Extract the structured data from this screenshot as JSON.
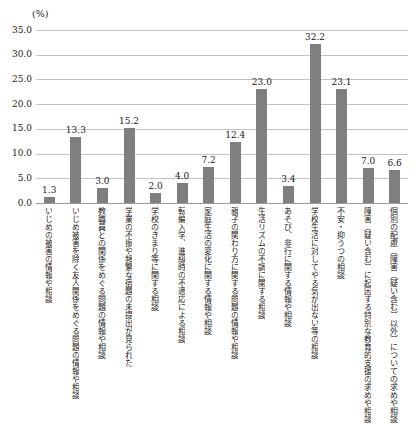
{
  "chart_data": {
    "type": "bar",
    "title": "",
    "unit_label": "(%)",
    "categories": [
      "いじめの被害の情報や相談",
      "いじめ被害を除く友人関係をめぐる問題の情報や相談",
      "教職員との関係をめぐる問題の情報や相談",
      "学業の不振や頻繁な宿題の未提出が見られた",
      "学校のきまり等に関する相談",
      "転編入学、進級時の不適応による相談",
      "家庭生活の変化に関する情報や相談",
      "親子の関わり方に関する問題の情報や相談",
      "生活リズムの不調に関する相談",
      "あそび、非行に関する情報や相談",
      "学校生活に対してやる気が出ない等の相談",
      "不安・抑うつの相談",
      "障害（疑い含む）に起因する特別な教育的支援の求めや相談",
      "個別の配慮（障害（疑い含む）以外）についての求めや相談"
    ],
    "values": [
      1.3,
      13.3,
      3.0,
      15.2,
      2.0,
      4.0,
      7.2,
      12.4,
      23.0,
      3.4,
      32.2,
      23.1,
      7.0,
      6.6
    ],
    "xlabel": "",
    "ylabel": "(%)",
    "ylim": [
      0,
      35
    ],
    "ytick_step": 5,
    "ytick_labels": [
      "0.0",
      "5.0",
      "10.0",
      "15.0",
      "20.0",
      "25.0",
      "30.0",
      "35.0"
    ],
    "grid": true,
    "legend_position": "none",
    "bar_color": "#7f7f7f",
    "gridline_color": "#c3c3c3",
    "axis_color": "#9a9a9a",
    "text_color": "#1a1a1a"
  }
}
